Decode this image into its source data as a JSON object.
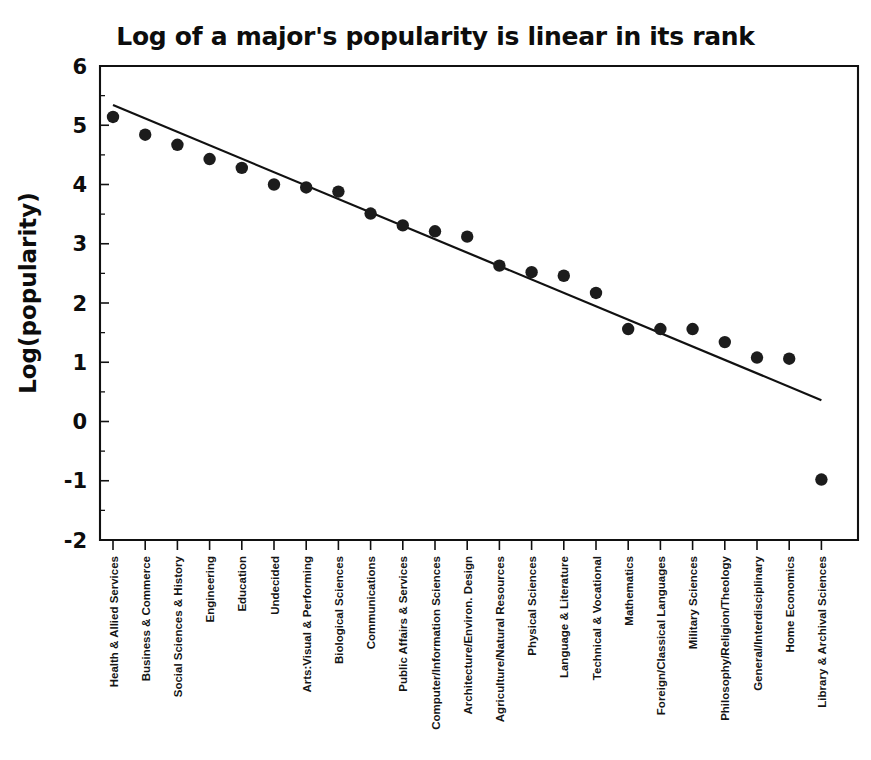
{
  "chart_data": {
    "type": "scatter",
    "title": "Log of a major's popularity is linear in its rank",
    "xlabel": "",
    "ylabel": "Log(popularity)",
    "ylim": [
      -2,
      6
    ],
    "yticks": [
      -2,
      -1,
      0,
      1,
      2,
      3,
      4,
      5,
      6
    ],
    "ytick_labels": [
      "-2",
      "-1",
      "0",
      "1",
      "2",
      "3",
      "4",
      "5",
      "6"
    ],
    "grid": false,
    "legend": null,
    "categories": [
      "Health & Allied Services",
      "Business & Commerce",
      "Social Sciences & History",
      "Engineering",
      "Education",
      "Undecided",
      "Arts:Visual & Performing",
      "Biological Sciences",
      "Communications",
      "Public Affairs & Services",
      "Computer/Information Sciences",
      "Architecture/Environ. Design",
      "Agriculture/Natural Resources",
      "Physical Sciences",
      "Language & Literature",
      "Technical & Vocational",
      "Mathematics",
      "Foreign/Classical Languages",
      "Military Sciences",
      "Philosophy/Religion/Theology",
      "General/Interdisciplinary",
      "Home Economics",
      "Library & Archival Sciences"
    ],
    "x": [
      1,
      2,
      3,
      4,
      5,
      6,
      7,
      8,
      9,
      10,
      11,
      12,
      13,
      14,
      15,
      16,
      17,
      18,
      19,
      20,
      21,
      22,
      23
    ],
    "values": [
      5.14,
      4.84,
      4.67,
      4.43,
      4.28,
      4.0,
      3.95,
      3.88,
      3.51,
      3.31,
      3.21,
      3.12,
      2.63,
      2.52,
      2.46,
      2.17,
      1.56,
      1.56,
      1.56,
      1.34,
      1.08,
      1.06,
      -0.98
    ],
    "series": [
      {
        "name": "Log(popularity) by rank",
        "values": [
          5.14,
          4.84,
          4.67,
          4.43,
          4.28,
          4.0,
          3.95,
          3.88,
          3.51,
          3.31,
          3.21,
          3.12,
          2.63,
          2.52,
          2.46,
          2.17,
          1.56,
          1.56,
          1.56,
          1.34,
          1.08,
          1.06,
          -0.98
        ]
      }
    ],
    "fit_line": {
      "type": "line",
      "x_start": 1,
      "y_start": 5.34,
      "x_end": 23,
      "y_end": 0.36
    },
    "annotations": []
  },
  "axes": {
    "y_axis_title": "Log(popularity)"
  }
}
